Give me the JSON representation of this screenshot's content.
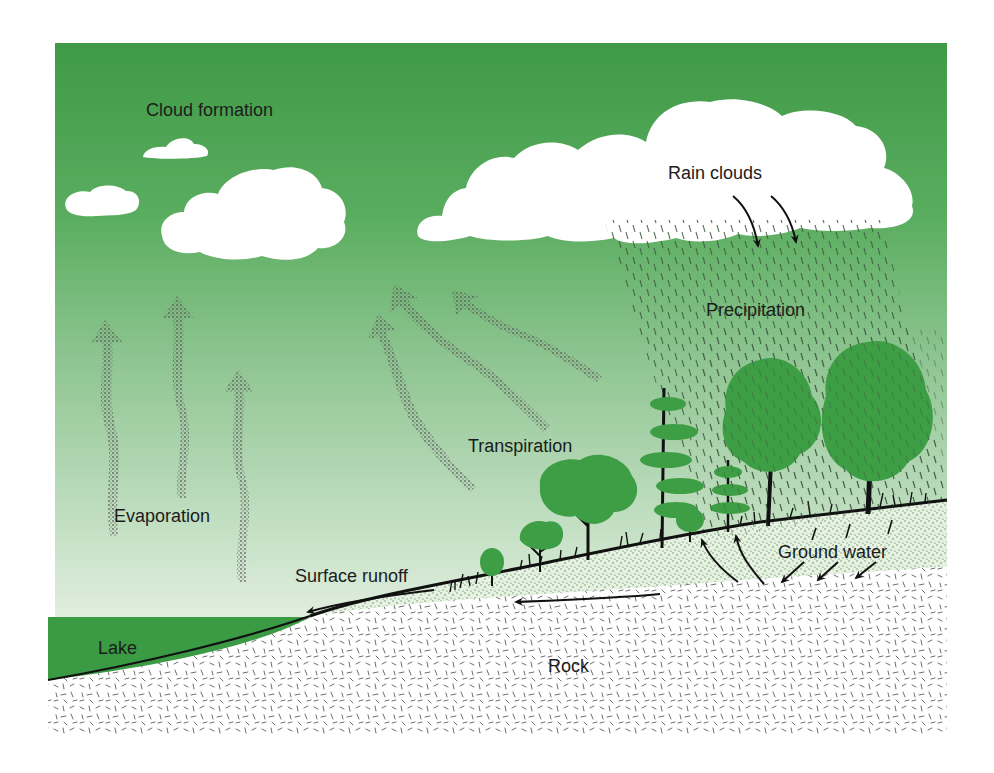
{
  "diagram": {
    "type": "water-cycle-illustration",
    "frame": {
      "x": 55,
      "y": 43,
      "width": 892,
      "height": 692
    },
    "colors": {
      "sky_top": "#3f9a47",
      "sky_mid": "#8fc592",
      "sky_bottom": "#e2efe0",
      "cloud": "#ffffff",
      "lake": "#3b9a44",
      "tree_foliage": "#3d9e45",
      "trunk": "#161616",
      "soil_stipple": "#5a9a5c",
      "soil_base": "#e6f1e2",
      "rock_base": "#ffffff",
      "rock_marks": "#6e6e6e",
      "vapor_arrow": "#6d6d6d",
      "flow_arrow": "#111111",
      "rain_streak": "#3d5a3e",
      "label_text": "#1c1c1c"
    },
    "labels": {
      "cloud_formation": "Cloud formation",
      "rain_clouds": "Rain clouds",
      "precipitation": "Precipitation",
      "evaporation": "Evaporation",
      "transpiration": "Transpiration",
      "surface_runoff": "Surface runoff",
      "ground_water": "Ground water",
      "lake": "Lake",
      "rock": "Rock"
    },
    "label_positions": {
      "cloud_formation": [
        146,
        116
      ],
      "rain_clouds": [
        668,
        179
      ],
      "precipitation": [
        706,
        316
      ],
      "evaporation": [
        114,
        522
      ],
      "transpiration": [
        468,
        452
      ],
      "surface_runoff": [
        295,
        582
      ],
      "ground_water": [
        778,
        558
      ],
      "lake": [
        98,
        654
      ],
      "rock": [
        548,
        672
      ]
    },
    "elements": {
      "clouds": [
        "small-cloud-left",
        "small-cloud-top",
        "formation-cloud",
        "rain-cloud"
      ],
      "evaporation_arrows": 3,
      "transpiration_arrows": 3,
      "rain_cloud_arrows": 2,
      "ground_water_arrows": 6,
      "runoff_arrows": 2,
      "trees": 9
    }
  }
}
